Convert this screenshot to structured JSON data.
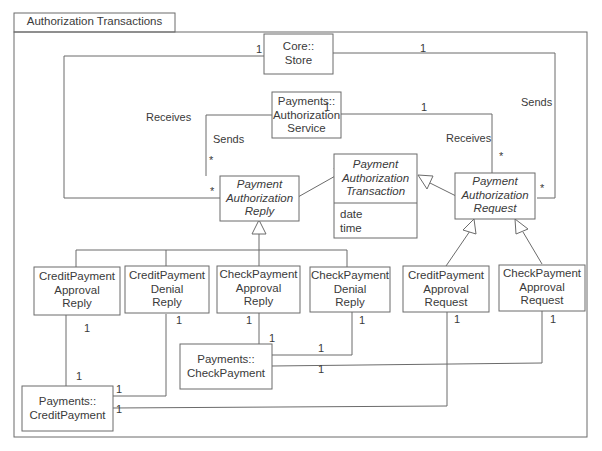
{
  "package": {
    "title": "Authorization Transactions"
  },
  "classes": {
    "core_store": {
      "name": "Core::\nStore"
    },
    "auth_service": {
      "name": "Payments::\nAuthorization\nService"
    },
    "auth_transaction": {
      "name": "Payment\nAuthorization\nTransaction",
      "abstract": true,
      "attributes": "date\ntime"
    },
    "auth_reply": {
      "name": "Payment\nAuthorization\nReply",
      "abstract": true
    },
    "auth_request": {
      "name": "Payment\nAuthorization\nRequest",
      "abstract": true
    },
    "credit_approval_reply": {
      "name": "CreditPayment\nApproval\nReply"
    },
    "credit_denial_reply": {
      "name": "CreditPayment\nDenial\nReply"
    },
    "check_approval_reply": {
      "name": "CheckPayment\nApproval\nReply"
    },
    "check_denial_reply": {
      "name": "CheckPayment\nDenial\nReply"
    },
    "credit_approval_request": {
      "name": "CreditPayment\nApproval\nRequest"
    },
    "check_approval_request": {
      "name": "CheckPayment\nApproval\nRequest"
    },
    "check_payment": {
      "name": "Payments::\nCheckPayment"
    },
    "credit_payment": {
      "name": "Payments::\nCreditPayment"
    }
  },
  "associations": {
    "store_receives": "Receives",
    "store_sends": "Sends",
    "service_sends": "Sends",
    "service_receives": "Receives"
  },
  "multiplicities": {
    "one": "1",
    "many": "*"
  }
}
